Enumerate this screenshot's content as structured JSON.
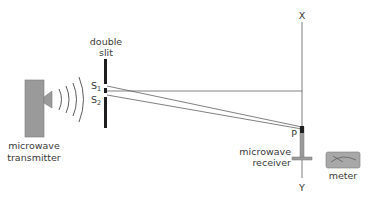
{
  "diagram": {
    "labels": {
      "double_slit_line1": "double",
      "double_slit_line2": "slit",
      "s1": "S",
      "s1_sub": "1",
      "s2": "S",
      "s2_sub": "2",
      "transmitter_line1": "microwave",
      "transmitter_line2": "transmitter",
      "receiver_line1": "microwave",
      "receiver_line2": "receiver",
      "point_p": "P",
      "axis_top": "X",
      "axis_bottom": "Y",
      "meter": "meter"
    },
    "components": [
      {
        "id": "microwave-transmitter",
        "label": "microwave transmitter"
      },
      {
        "id": "double-slit",
        "label": "double slit",
        "slits": [
          "S1",
          "S2"
        ]
      },
      {
        "id": "microwave-receiver",
        "label": "microwave receiver",
        "position": "P"
      },
      {
        "id": "meter",
        "label": "meter"
      },
      {
        "id": "line-xy",
        "label": "XY"
      }
    ],
    "colors": {
      "line": "#4a4a4a",
      "device_fill": "#9a9a9a",
      "slit": "#1e1e1e",
      "text": "#3a3a3a"
    }
  }
}
